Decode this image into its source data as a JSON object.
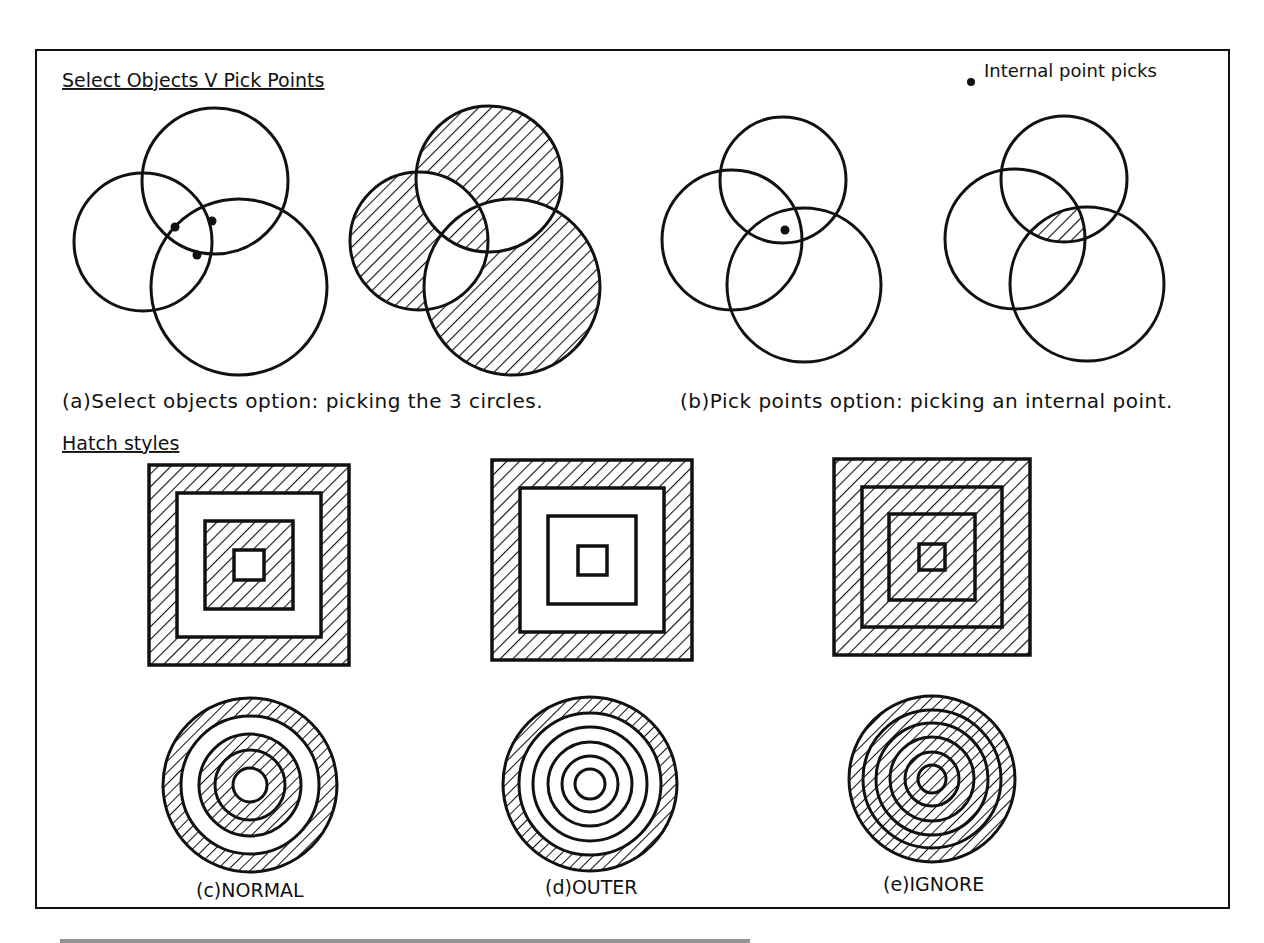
{
  "figure": {
    "frame": {
      "x": 36,
      "y": 50,
      "width": 1193,
      "height": 858,
      "stroke": "#111111"
    },
    "section_top": {
      "heading": "Select Objects V Pick Points",
      "legend": {
        "marker": "filled-dot",
        "label": "Internal point picks"
      },
      "panels": [
        {
          "id": "a",
          "caption": "(a)Select objects option: picking the 3 circles.",
          "before": {
            "circles": [
              {
                "cx": 215,
                "cy": 181,
                "r": 73
              },
              {
                "cx": 143,
                "cy": 242,
                "r": 69
              },
              {
                "cx": 239,
                "cy": 287,
                "r": 88
              }
            ],
            "pick_points": [
              {
                "x": 175,
                "y": 227
              },
              {
                "x": 212,
                "y": 221
              },
              {
                "x": 197,
                "y": 255
              }
            ]
          },
          "after": {
            "circles": [
              {
                "cx": 489,
                "cy": 179,
                "r": 73
              },
              {
                "cx": 419,
                "cy": 241,
                "r": 69
              },
              {
                "cx": 512,
                "cy": 287,
                "r": 88
              }
            ],
            "hatch": "normal (alternating regions)"
          }
        },
        {
          "id": "b",
          "caption": "(b)Pick points option: picking an internal point.",
          "before": {
            "circles": [
              {
                "cx": 783,
                "cy": 180,
                "r": 63
              },
              {
                "cx": 732,
                "cy": 240,
                "r": 70
              },
              {
                "cx": 804,
                "cy": 285,
                "r": 77
              }
            ],
            "pick_points": [
              {
                "x": 785,
                "y": 230
              }
            ]
          },
          "after": {
            "circles": [
              {
                "cx": 1064,
                "cy": 179,
                "r": 63
              },
              {
                "cx": 1015,
                "cy": 239,
                "r": 70
              },
              {
                "cx": 1087,
                "cy": 284,
                "r": 77
              }
            ],
            "hatch": "triple intersection only"
          }
        }
      ]
    },
    "section_bottom": {
      "heading": "Hatch styles",
      "styles": [
        {
          "id": "c",
          "caption": "(c)NORMAL",
          "squares": {
            "cx": 249,
            "cy": 565,
            "half_sizes": [
              100,
              72,
              44,
              15
            ]
          },
          "circles": {
            "cx": 250,
            "cy": 785,
            "radii": [
              87,
              69,
              51,
              35,
              17
            ]
          },
          "square_hatched_bands": [
            0,
            2
          ],
          "circle_hatched_bands": [
            0,
            2,
            3
          ]
        },
        {
          "id": "d",
          "caption": "(d)OUTER",
          "squares": {
            "cx": 592,
            "cy": 565,
            "half_sizes": [
              100,
              72,
              44,
              15
            ]
          },
          "circles": {
            "cx": 590,
            "cy": 784,
            "radii": [
              87,
              71,
              57,
              42,
              28,
              15
            ]
          },
          "square_hatched_bands": [
            0
          ],
          "circle_hatched_bands": [
            0
          ]
        },
        {
          "id": "e",
          "caption": "(e)IGNORE",
          "squares": {
            "cx": 932,
            "cy": 562,
            "half_sizes": [
              98,
              70,
              43,
              13
            ]
          },
          "circles": {
            "cx": 932,
            "cy": 779,
            "radii": [
              83,
              69,
              56,
              42,
              27,
              14
            ]
          },
          "square_hatched_bands": "all",
          "circle_hatched_bands": "all"
        }
      ]
    },
    "footer_caption_visible": "clipped (text cut off at bottom edge, unreadable)",
    "colors": {
      "ink": "#111111",
      "paper": "#ffffff"
    }
  }
}
